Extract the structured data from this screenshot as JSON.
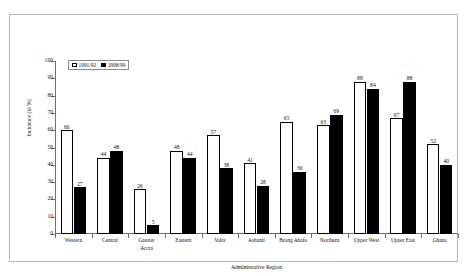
{
  "chart_data": {
    "type": "bar",
    "title": "",
    "xlabel": "Administrative Region",
    "ylabel": "Incidence (in %)",
    "ylim": [
      0,
      100
    ],
    "ytick_step": 10,
    "yticks": [
      "100",
      "90",
      "80",
      "70",
      "60",
      "50",
      "40",
      "30",
      "20",
      "10",
      "0"
    ],
    "grid": false,
    "legend_position": "top-left-inside",
    "categories": [
      "Western",
      "Central",
      "Greater Accra",
      "Eastern",
      "Volta",
      "Ashanti",
      "Brong Ahafo",
      "Northern",
      "Upper West",
      "Upper East",
      "Ghana"
    ],
    "series": [
      {
        "name": "1991/92",
        "color": "#ffffff",
        "values": [
          60,
          44,
          26,
          48,
          57,
          41,
          65,
          63,
          88,
          67,
          52
        ]
      },
      {
        "name": "1998/99",
        "color": "#000000",
        "values": [
          27,
          48,
          5,
          44,
          38,
          28,
          36,
          69,
          84,
          88,
          40
        ]
      }
    ]
  },
  "legend": {
    "items": [
      {
        "label": "1991/92",
        "swatch": "hollow"
      },
      {
        "label": "1998/99",
        "swatch": "filled"
      }
    ]
  },
  "axes": {
    "x_title": "Administrative Region",
    "y_title": "Incidence (in %)"
  }
}
